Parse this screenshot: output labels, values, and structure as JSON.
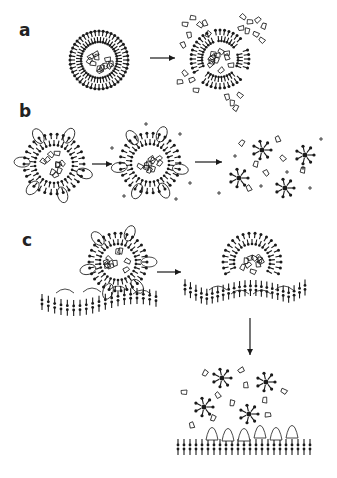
{
  "figure": {
    "panels": [
      {
        "label": "a",
        "description": "Intact vesicle with bilayer membrane and encapsulated cargo ruptures into fragmented membrane releasing cargo",
        "stages": [
          "intact-vesicle",
          "ruptured-vesicle-with-released-cargo"
        ]
      },
      {
        "label": "b",
        "description": "Vesicle with membrane-inserted molecules, exposed to ions, dissolves into micelles with released cargo",
        "stages": [
          "vesicle-with-inserted-molecules",
          "vesicle-with-ions",
          "micelles-and-released-cargo"
        ]
      },
      {
        "label": "c",
        "description": "Vesicle docks to target membrane, fuses, and releases micelles and cargo above target membrane with receptors",
        "stages": [
          "vesicle-docking-to-membrane",
          "vesicle-fusing-with-membrane",
          "micelles-released-over-membrane"
        ]
      }
    ],
    "colors": {
      "ink": "#1a1a1a",
      "background": "#ffffff"
    }
  }
}
